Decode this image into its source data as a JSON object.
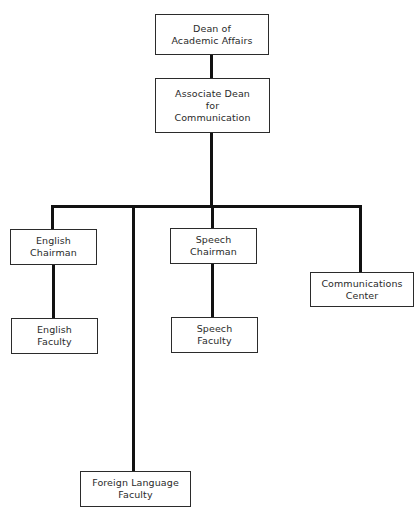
{
  "diagram": {
    "type": "org-chart",
    "nodes": {
      "dean": {
        "lines": [
          "Dean of",
          "Academic Affairs"
        ]
      },
      "assoc_dean": {
        "lines": [
          "Associate Dean",
          "for",
          "Communication"
        ]
      },
      "english_chair": {
        "lines": [
          "English",
          "Chairman"
        ]
      },
      "english_faculty": {
        "lines": [
          "English",
          "Faculty"
        ]
      },
      "speech_chair": {
        "lines": [
          "Speech",
          "Chairman"
        ]
      },
      "speech_faculty": {
        "lines": [
          "Speech",
          "Faculty"
        ]
      },
      "comm_center": {
        "lines": [
          "Communications",
          "Center"
        ]
      },
      "foreign_lang": {
        "lines": [
          "Foreign Language",
          "Faculty"
        ]
      }
    },
    "edges": [
      [
        "dean",
        "assoc_dean"
      ],
      [
        "assoc_dean",
        "english_chair"
      ],
      [
        "assoc_dean",
        "foreign_lang"
      ],
      [
        "assoc_dean",
        "speech_chair"
      ],
      [
        "assoc_dean",
        "comm_center"
      ],
      [
        "english_chair",
        "english_faculty"
      ],
      [
        "speech_chair",
        "speech_faculty"
      ]
    ],
    "colors": {
      "line": "#111111",
      "border": "#2b2b2b",
      "background": "#ffffff"
    }
  }
}
